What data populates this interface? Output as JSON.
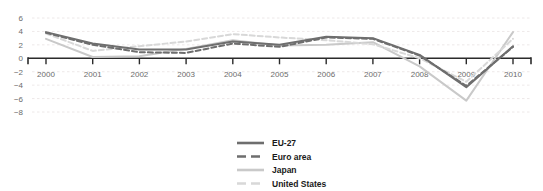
{
  "title_clipped": "Figure 1: Real GDP growth rate (% change on previous year)",
  "chart_data": {
    "type": "line",
    "title": "",
    "xlabel": "",
    "ylabel": "",
    "x": [
      2000,
      2001,
      2002,
      2003,
      2004,
      2005,
      2006,
      2007,
      2008,
      2009,
      2010
    ],
    "categories": [
      "2000",
      "2001",
      "2002",
      "2003",
      "2004",
      "2005",
      "2006",
      "2007",
      "2008",
      "2009",
      "2010"
    ],
    "ylim": [
      -8,
      6
    ],
    "yticks": [
      6,
      4,
      2,
      0,
      -2,
      -4,
      -6,
      -8
    ],
    "ytick_labels": [
      "6",
      "4",
      "2",
      "0",
      "−2",
      "−4",
      "−6",
      "−8"
    ],
    "grid": true,
    "grid_style": "dashed-horizontal",
    "zero_line": 0,
    "legend_position": "bottom-center",
    "series": [
      {
        "name": "EU-27",
        "color": "#6e6e6e",
        "style": "solid",
        "values": [
          3.9,
          2.2,
          1.3,
          1.3,
          2.5,
          2.0,
          3.2,
          3.0,
          0.5,
          -4.3,
          1.8
        ]
      },
      {
        "name": "Euro area",
        "color": "#6e6e6e",
        "style": "dashed",
        "values": [
          3.8,
          2.0,
          0.9,
          0.8,
          2.2,
          1.7,
          3.1,
          2.9,
          0.4,
          -4.1,
          1.7
        ]
      },
      {
        "name": "Japan",
        "color": "#c9c9c9",
        "style": "solid",
        "values": [
          2.9,
          0.2,
          0.3,
          1.4,
          2.7,
          1.9,
          2.0,
          2.4,
          -1.2,
          -6.3,
          3.9
        ]
      },
      {
        "name": "United States",
        "color": "#d8d8d8",
        "style": "dashed",
        "values": [
          3.7,
          1.1,
          1.8,
          2.5,
          3.6,
          3.1,
          2.7,
          2.1,
          0.0,
          -3.5,
          2.9
        ]
      }
    ]
  },
  "legend": {
    "items": [
      {
        "label": "EU-27"
      },
      {
        "label": "Euro area"
      },
      {
        "label": "Japan"
      },
      {
        "label": "United States"
      }
    ]
  }
}
